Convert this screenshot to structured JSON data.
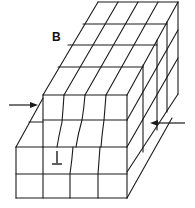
{
  "figure": {
    "panel_label": "B",
    "line_color": "#1a1a1a",
    "background": "#ffffff",
    "annotations": {
      "left_arrow": "compression arrow pointing right",
      "right_arrow": "compression arrow pointing left",
      "dislocation_symbol": "⊥"
    }
  }
}
